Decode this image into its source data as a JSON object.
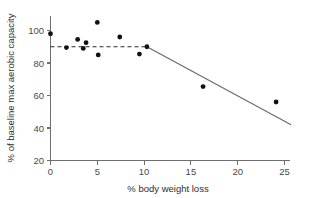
{
  "chart_data": {
    "type": "scatter",
    "title": "",
    "xlabel": "% body weight loss",
    "ylabel": "% of baseline max aerobic capacity",
    "xlim": [
      0,
      25
    ],
    "ylim": [
      20,
      105
    ],
    "xticks": [
      0,
      5,
      10,
      15,
      20,
      25
    ],
    "yticks": [
      20,
      40,
      60,
      80,
      100
    ],
    "xtick_labels": [
      "0",
      "5",
      "10",
      "15",
      "20",
      "25"
    ],
    "ytick_labels": [
      "20",
      "40",
      "60",
      "80",
      "100"
    ],
    "grid": false,
    "legend": false,
    "point_color": "#111111",
    "points": [
      {
        "x": 0.0,
        "y": 98.0
      },
      {
        "x": 1.7,
        "y": 89.5
      },
      {
        "x": 2.9,
        "y": 94.5
      },
      {
        "x": 3.5,
        "y": 89.0
      },
      {
        "x": 3.8,
        "y": 92.5
      },
      {
        "x": 5.0,
        "y": 105.0
      },
      {
        "x": 5.1,
        "y": 85.0
      },
      {
        "x": 7.4,
        "y": 96.0
      },
      {
        "x": 9.5,
        "y": 85.5
      },
      {
        "x": 10.3,
        "y": 90.0
      },
      {
        "x": 16.3,
        "y": 65.5
      },
      {
        "x": 24.1,
        "y": 56.0
      }
    ],
    "segments": [
      {
        "name": "plateau-segment",
        "style": "dashed",
        "color": "#2b2b2b",
        "x0": 0.0,
        "y0": 90.0,
        "x1": 10.3,
        "y1": 90.0
      },
      {
        "name": "decline-segment",
        "style": "solid",
        "color": "#6a6a6a",
        "x0": 10.3,
        "y0": 90.0,
        "x1": 25.7,
        "y1": 42.0
      }
    ]
  }
}
